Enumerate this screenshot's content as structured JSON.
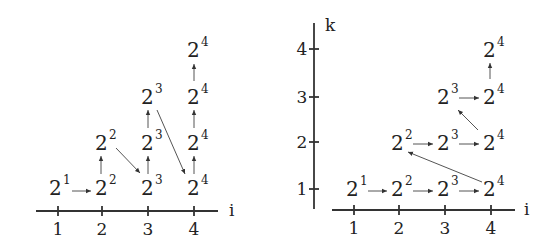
{
  "diagrams": [
    {
      "id": "left",
      "axes": {
        "x_label": "i",
        "x_ticks": [
          "1",
          "2",
          "3",
          "4"
        ]
      },
      "nodes": [
        {
          "i": 1,
          "row": 1,
          "base": "2",
          "exp": "1"
        },
        {
          "i": 2,
          "row": 1,
          "base": "2",
          "exp": "2"
        },
        {
          "i": 2,
          "row": 2,
          "base": "2",
          "exp": "2"
        },
        {
          "i": 3,
          "row": 1,
          "base": "2",
          "exp": "3"
        },
        {
          "i": 3,
          "row": 2,
          "base": "2",
          "exp": "3"
        },
        {
          "i": 3,
          "row": 3,
          "base": "2",
          "exp": "3"
        },
        {
          "i": 4,
          "row": 1,
          "base": "2",
          "exp": "4"
        },
        {
          "i": 4,
          "row": 2,
          "base": "2",
          "exp": "4"
        },
        {
          "i": 4,
          "row": 3,
          "base": "2",
          "exp": "4"
        },
        {
          "i": 4,
          "row": 4,
          "base": "2",
          "exp": "4"
        }
      ],
      "edges": [
        {
          "from": [
            1,
            1
          ],
          "to": [
            2,
            1
          ]
        },
        {
          "from": [
            2,
            1
          ],
          "to": [
            2,
            2
          ]
        },
        {
          "from": [
            2,
            2
          ],
          "to": [
            3,
            1
          ]
        },
        {
          "from": [
            3,
            1
          ],
          "to": [
            3,
            2
          ]
        },
        {
          "from": [
            3,
            2
          ],
          "to": [
            3,
            3
          ]
        },
        {
          "from": [
            3,
            3
          ],
          "to": [
            4,
            1
          ]
        },
        {
          "from": [
            4,
            1
          ],
          "to": [
            4,
            2
          ]
        },
        {
          "from": [
            4,
            2
          ],
          "to": [
            4,
            3
          ]
        },
        {
          "from": [
            4,
            3
          ],
          "to": [
            4,
            4
          ]
        }
      ]
    },
    {
      "id": "right",
      "axes": {
        "x_label": "i",
        "y_label": "k",
        "x_ticks": [
          "1",
          "2",
          "3",
          "4"
        ],
        "y_ticks": [
          "1",
          "2",
          "3",
          "4"
        ]
      },
      "nodes": [
        {
          "i": 1,
          "k": 1,
          "base": "2",
          "exp": "1"
        },
        {
          "i": 2,
          "k": 1,
          "base": "2",
          "exp": "2"
        },
        {
          "i": 3,
          "k": 1,
          "base": "2",
          "exp": "3"
        },
        {
          "i": 4,
          "k": 1,
          "base": "2",
          "exp": "4"
        },
        {
          "i": 2,
          "k": 2,
          "base": "2",
          "exp": "2"
        },
        {
          "i": 3,
          "k": 2,
          "base": "2",
          "exp": "3"
        },
        {
          "i": 4,
          "k": 2,
          "base": "2",
          "exp": "4"
        },
        {
          "i": 3,
          "k": 3,
          "base": "2",
          "exp": "3"
        },
        {
          "i": 4,
          "k": 3,
          "base": "2",
          "exp": "4"
        },
        {
          "i": 4,
          "k": 4,
          "base": "2",
          "exp": "4"
        }
      ],
      "edges": [
        {
          "from": [
            1,
            1
          ],
          "to": [
            2,
            1
          ]
        },
        {
          "from": [
            2,
            1
          ],
          "to": [
            3,
            1
          ]
        },
        {
          "from": [
            3,
            1
          ],
          "to": [
            4,
            1
          ]
        },
        {
          "from": [
            4,
            1
          ],
          "to": [
            2,
            2
          ]
        },
        {
          "from": [
            2,
            2
          ],
          "to": [
            3,
            2
          ]
        },
        {
          "from": [
            3,
            2
          ],
          "to": [
            4,
            2
          ]
        },
        {
          "from": [
            4,
            2
          ],
          "to": [
            3,
            3
          ]
        },
        {
          "from": [
            3,
            3
          ],
          "to": [
            4,
            3
          ]
        },
        {
          "from": [
            4,
            3
          ],
          "to": [
            4,
            4
          ]
        }
      ]
    }
  ],
  "colors": {
    "ink": "#222222",
    "arrow": "#555555",
    "background": "#ffffff"
  }
}
